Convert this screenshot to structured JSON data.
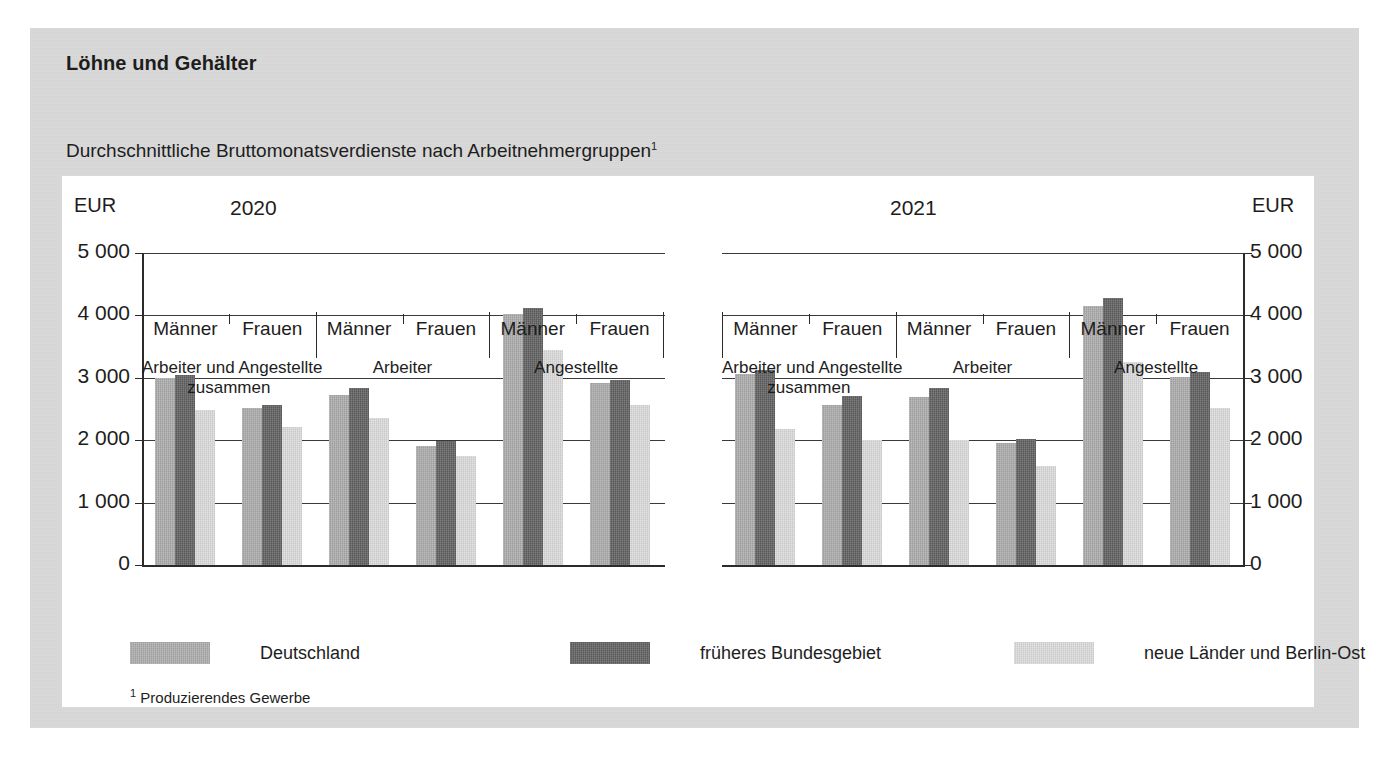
{
  "card": {
    "title": "Löhne und Gehälter",
    "subtitle": "Durchschnittliche Bruttomonatsverdienste nach Arbeitnehmergruppen",
    "subtitle_footnote_marker": "1",
    "footnote_marker": "1",
    "footnote_text": " Produzierendes Gewerbe"
  },
  "axis": {
    "unit_left": "EUR",
    "unit_right": "EUR",
    "ticks": [
      "5 000",
      "4 000",
      "3 000",
      "2 000",
      "1 000",
      "0"
    ]
  },
  "colors": {
    "series_deutschland": "#adadad",
    "series_frueheres_bundesgebiet": "#626262",
    "series_neue_laender": "#dddddd",
    "card_background": "#d8d8d8",
    "plot_background": "#ffffff",
    "axis": "#2b2b2b"
  },
  "legend": [
    {
      "label": "Deutschland",
      "color": "#adadad"
    },
    {
      "label": "früheres Bundesgebiet",
      "color": "#626262"
    },
    {
      "label": "neue Länder und Berlin-Ost",
      "color": "#dddddd"
    }
  ],
  "chart_data": {
    "type": "bar",
    "title": "Durchschnittliche Bruttomonatsverdienste nach Arbeitnehmergruppen",
    "subtitle": "Löhne und Gehälter",
    "xlabel": "",
    "ylabel": "EUR",
    "ylim": [
      0,
      5000
    ],
    "ytick_values": [
      0,
      1000,
      2000,
      3000,
      4000,
      5000
    ],
    "ytick_labels": [
      "0",
      "1 000",
      "2 000",
      "3 000",
      "4 000",
      "5 000"
    ],
    "grid": true,
    "legend_position": "bottom",
    "series_names": [
      "Deutschland",
      "früheres Bundesgebiet",
      "neue Länder und Berlin-Ost"
    ],
    "panels": [
      {
        "title": "2020",
        "groups": [
          {
            "label": "Arbeiter und Angestellte",
            "label_line2": "zusammen",
            "subgroups": [
              {
                "label": "Männer",
                "values": [
                  3000,
                  3050,
                  2480
                ]
              },
              {
                "label": "Frauen",
                "values": [
                  2510,
                  2570,
                  2210
                ]
              }
            ]
          },
          {
            "label": "Arbeiter",
            "label_line2": "",
            "subgroups": [
              {
                "label": "Männer",
                "values": [
                  2730,
                  2830,
                  2360
                ]
              },
              {
                "label": "Frauen",
                "values": [
                  1900,
                  1980,
                  1740
                ]
              }
            ]
          },
          {
            "label": "Angestellte",
            "label_line2": "",
            "subgroups": [
              {
                "label": "Männer",
                "values": [
                  4030,
                  4120,
                  3450
                ]
              },
              {
                "label": "Frauen",
                "values": [
                  2910,
                  2960,
                  2570
                ]
              }
            ]
          }
        ]
      },
      {
        "title": "2021",
        "groups": [
          {
            "label": "Arbeiter und Angestellte",
            "label_line2": "zusammen",
            "subgroups": [
              {
                "label": "Männer",
                "values": [
                  3060,
                  3130,
                  2180
                ]
              },
              {
                "label": "Frauen",
                "values": [
                  2560,
                  2710,
                  2000
                ]
              }
            ]
          },
          {
            "label": "Arbeiter",
            "label_line2": "",
            "subgroups": [
              {
                "label": "Männer",
                "values": [
                  2700,
                  2840,
                  2010
                ]
              },
              {
                "label": "Frauen",
                "values": [
                  1950,
                  2020,
                  1590
                ]
              }
            ]
          },
          {
            "label": "Angestellte",
            "label_line2": "",
            "subgroups": [
              {
                "label": "Männer",
                "values": [
                  4150,
                  4280,
                  3260
                ]
              },
              {
                "label": "Frauen",
                "values": [
                  3020,
                  3100,
                  2520
                ]
              }
            ]
          }
        ]
      }
    ]
  }
}
